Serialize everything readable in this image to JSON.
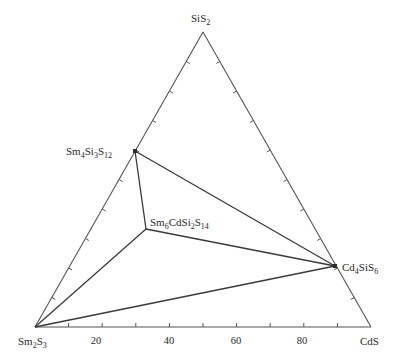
{
  "diagram": {
    "type": "ternary-phase-diagram",
    "vertices": {
      "top": {
        "label": "SiS",
        "sub": "2",
        "x": 203,
        "y": 32
      },
      "left": {
        "label": "Sm",
        "sub1": "2",
        "mid": "S",
        "sub2": "3",
        "x": 35,
        "y": 327
      },
      "right": {
        "label": "CdS",
        "x": 371,
        "y": 327
      }
    },
    "compounds": [
      {
        "id": "sm4si3s12",
        "parts": [
          [
            "Sm",
            ""
          ],
          [
            "",
            "4"
          ],
          [
            "Si",
            ""
          ],
          [
            "",
            "3"
          ],
          [
            "S",
            ""
          ],
          [
            "",
            "12"
          ]
        ],
        "x": 135,
        "y": 151
      },
      {
        "id": "sm6cdsi2s14",
        "parts": [
          [
            "Sm",
            ""
          ],
          [
            "",
            "6"
          ],
          [
            "CdSi",
            ""
          ],
          [
            "",
            "2"
          ],
          [
            "S",
            ""
          ],
          [
            "",
            "14"
          ]
        ],
        "x": 146,
        "y": 229
      },
      {
        "id": "cd4sis6",
        "parts": [
          [
            "Cd",
            ""
          ],
          [
            "",
            "4"
          ],
          [
            "SiS",
            ""
          ],
          [
            "",
            "6"
          ]
        ],
        "x": 335,
        "y": 266
      }
    ],
    "bottom_axis_ticks": [
      "20",
      "40",
      "60",
      "80"
    ],
    "tick_interval_percent": 10,
    "tie_lines": [
      [
        "sm4si3s12",
        "sm6cdsi2s14"
      ],
      [
        "sm4si3s12",
        "cd4sis6"
      ],
      [
        "sm6cdsi2s14",
        "cd4sis6"
      ],
      [
        "sm6cdsi2s14",
        "Sm2S3"
      ],
      [
        "cd4sis6",
        "Sm2S3"
      ]
    ],
    "colors": {
      "line": "#3a3a3a",
      "edge": "#555555",
      "text": "#2a2a2a"
    }
  },
  "labels": {
    "top_main": "SiS",
    "top_sub": "2",
    "left_a": "Sm",
    "left_a_sub": "2",
    "left_b": "S",
    "left_b_sub": "3",
    "right": "CdS",
    "c1_a": "Sm",
    "c1_a_sub": "4",
    "c1_b": "Si",
    "c1_b_sub": "3",
    "c1_c": "S",
    "c1_c_sub": "12",
    "c2_a": "Sm",
    "c2_a_sub": "6",
    "c2_b": "CdSi",
    "c2_b_sub": "2",
    "c2_c": "S",
    "c2_c_sub": "14",
    "c3_a": "Cd",
    "c3_a_sub": "4",
    "c3_b": "SiS",
    "c3_b_sub": "6",
    "tick_20": "20",
    "tick_40": "40",
    "tick_60": "60",
    "tick_80": "80"
  }
}
